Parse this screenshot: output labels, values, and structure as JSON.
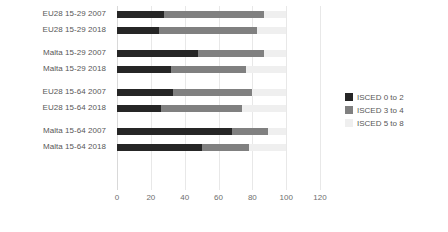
{
  "chart_data": {
    "type": "bar",
    "orientation": "horizontal",
    "stacked": true,
    "title": "",
    "subtitle": "",
    "xlabel": "",
    "ylabel": "",
    "xlim": [
      0,
      120
    ],
    "xticks": [
      "0",
      "20",
      "40",
      "60",
      "80",
      "100",
      "120"
    ],
    "xtick_values": [
      0,
      20,
      40,
      60,
      80,
      100,
      120
    ],
    "grid": true,
    "grid_axis": "x",
    "legend_position": "right",
    "categories": [
      "EU28 15-29 2007",
      "EU28 15-29 2018",
      "Malta 15-29 2007",
      "Malta 15-29 2018",
      "EU28 15-64 2007",
      "EU28 15-64 2018",
      "Malta 15-64 2007",
      "Malta 15-64 2018"
    ],
    "group_breaks": [
      2,
      4,
      6
    ],
    "series": [
      {
        "name": "ISCED 0 to 2",
        "color": "#262626",
        "values": [
          28,
          25,
          48,
          32,
          33,
          26,
          68,
          50
        ]
      },
      {
        "name": "ISCED 3 to 4",
        "color": "#808080",
        "values": [
          59,
          58,
          39,
          44,
          47,
          48,
          21,
          28
        ]
      },
      {
        "name": "ISCED 5 to 8",
        "color": "#efefef",
        "values": [
          13,
          17,
          13,
          24,
          20,
          26,
          11,
          22
        ]
      }
    ]
  },
  "legend": {
    "items": [
      {
        "label": "ISCED 0 to 2",
        "color": "#262626"
      },
      {
        "label": "ISCED 3 to 4",
        "color": "#808080"
      },
      {
        "label": "ISCED 5 to 8",
        "color": "#efefef"
      }
    ]
  }
}
